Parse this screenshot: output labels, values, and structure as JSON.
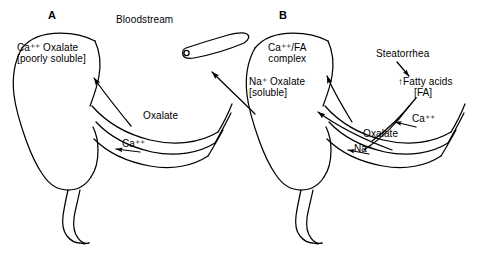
{
  "figure": {
    "background_color": "#ffffff",
    "stroke_color": "#000000"
  },
  "panels": [
    {
      "id": "A",
      "letter": "A",
      "labels": {
        "lumen_complex_line1": "Ca⁺⁺ Oxalate",
        "lumen_complex_line2": "[poorly soluble]",
        "arrow_oxalate": "Oxalate",
        "arrow_calcium": "Ca⁺⁺"
      }
    },
    {
      "id": "B",
      "letter": "B",
      "labels": {
        "complex_line1": "Ca⁺⁺/FA",
        "complex_line2": "complex",
        "lumen_oxalate_line1": "Na⁺ Oxalate",
        "lumen_oxalate_line2": "[soluble]",
        "steatorrhea": "Steatorrhea",
        "fatty_acids_line1": "Fatty acids",
        "fatty_acids_line2": "[FA]",
        "fatty_acids_increase_marker": "↑",
        "arrow_calcium": "Ca⁺⁺",
        "arrow_oxalate": "Oxalate",
        "arrow_sodium": "Na⁺"
      }
    }
  ],
  "shared": {
    "bloodstream_label": "Bloodstream"
  },
  "icons": {
    "bloodstream": "blood-vessel-icon",
    "colon": "colon-anatomy-icon",
    "intestinal_loops": "intestinal-loop-icon"
  }
}
